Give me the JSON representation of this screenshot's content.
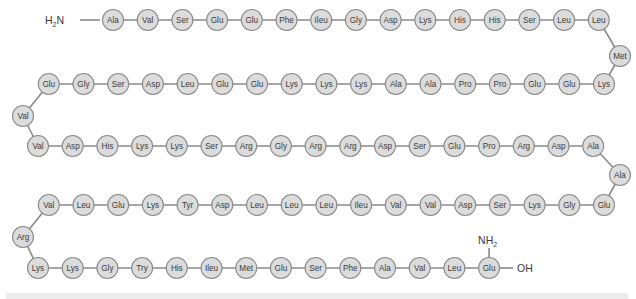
{
  "diagram": {
    "n_terminus": {
      "label": "H",
      "sub": "2",
      "suffix": "N"
    },
    "c_terminus": {
      "label": "OH"
    },
    "side_group": {
      "label": "NH",
      "sub": "2",
      "attached_to_index": 103
    },
    "colors": {
      "circle_fill": "#dcdcdc",
      "circle_stroke": "#8a8a8a",
      "bond": "#8a8a8a",
      "text": "#3a3a3a"
    },
    "rows": [
      {
        "y": 20,
        "direction": "ltr",
        "x_start": 113,
        "step": 34.7,
        "residues": [
          "Ala",
          "Val",
          "Ser",
          "Glu",
          "Glu",
          "Phe",
          "Ileu",
          "Gly",
          "Asp",
          "Lys",
          "His",
          "His",
          "Ser",
          "Leu",
          "Leu"
        ]
      },
      {
        "turn": {
          "x": 620,
          "y": 56,
          "residue": "Met"
        }
      },
      {
        "y": 84,
        "direction": "rtl",
        "x_start": 604,
        "step": 34.7,
        "residues": [
          "Lys",
          "Glu",
          "Glu",
          "Pro",
          "Pro",
          "Ala",
          "Ala",
          "Lys",
          "Lys",
          "Lys",
          "Glu",
          "Glu",
          "Leu",
          "Asp",
          "Ser",
          "Gly",
          "Glu"
        ]
      },
      {
        "turn": {
          "x": 23,
          "y": 116,
          "residue": "Val"
        }
      },
      {
        "y": 146,
        "direction": "ltr",
        "x_start": 38,
        "step": 34.7,
        "residues": [
          "Val",
          "Asp",
          "His",
          "Lys",
          "Lys",
          "Ser",
          "Arg",
          "Gly",
          "Arg",
          "Arg",
          "Asp",
          "Ser",
          "Glu",
          "Pro",
          "Arg",
          "Asp",
          "Ala"
        ]
      },
      {
        "turn": {
          "x": 620,
          "y": 175,
          "residue": "Ala"
        }
      },
      {
        "y": 205,
        "direction": "rtl",
        "x_start": 604,
        "step": 34.7,
        "residues": [
          "Glu",
          "Gly",
          "Lys",
          "Ser",
          "Asp",
          "Val",
          "Val",
          "Ileu",
          "Leu",
          "Leu",
          "Leu",
          "Asp",
          "Tyr",
          "Lys",
          "Glu",
          "Leu",
          "Val"
        ]
      },
      {
        "turn": {
          "x": 23,
          "y": 237,
          "residue": "Arg"
        }
      },
      {
        "y": 268,
        "direction": "ltr",
        "x_start": 38,
        "step": 34.7,
        "residues": [
          "Lys",
          "Lys",
          "Gly",
          "Try",
          "His",
          "Ileu",
          "Met",
          "Glu",
          "Ser",
          "Phe",
          "Ala",
          "Val",
          "Leu",
          "Glu"
        ]
      }
    ]
  }
}
